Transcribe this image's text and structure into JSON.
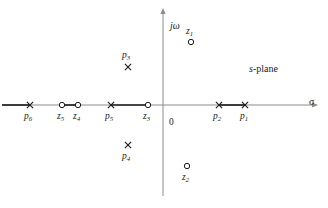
{
  "figure": {
    "kind": "s-plane pole-zero plot",
    "annotation": "s-plane",
    "origin_label": "0",
    "axes": {
      "real": {
        "symbol": "σ",
        "name": "sigma-axis"
      },
      "imag": {
        "symbol": "jω",
        "name": "j-omega-axis"
      }
    },
    "colors": {
      "axis": "#8c8c8c",
      "segment": "#1a1a1a",
      "marker": "#1a1a1a",
      "text": "#1a1a1a",
      "background": "#ffffff"
    }
  },
  "chart_data": {
    "type": "scatter",
    "title": "s-plane",
    "xlabel": "σ",
    "ylabel": "jω",
    "grid": false,
    "legend": null,
    "axis_origin_px": {
      "x": 163,
      "y": 105
    },
    "markers": [
      {
        "id": "p1",
        "label": "p",
        "sub": "1",
        "type": "pole",
        "glyph": "x",
        "x": 245,
        "y": 105,
        "label_x": 240,
        "label_y": 112,
        "on_real_axis": true
      },
      {
        "id": "p2",
        "label": "p",
        "sub": "2",
        "type": "pole",
        "glyph": "x",
        "x": 219,
        "y": 105,
        "label_x": 213,
        "label_y": 112,
        "on_real_axis": true
      },
      {
        "id": "p3",
        "label": "p",
        "sub": "3",
        "type": "pole",
        "glyph": "x",
        "x": 128,
        "y": 67,
        "label_x": 122,
        "label_y": 51,
        "on_real_axis": false
      },
      {
        "id": "p4",
        "label": "p",
        "sub": "4",
        "type": "pole",
        "glyph": "x",
        "x": 128,
        "y": 145,
        "label_x": 122,
        "label_y": 152,
        "on_real_axis": false
      },
      {
        "id": "p5",
        "label": "p",
        "sub": "5",
        "type": "pole",
        "glyph": "x",
        "x": 111,
        "y": 105,
        "label_x": 105,
        "label_y": 112,
        "on_real_axis": true
      },
      {
        "id": "p6",
        "label": "p",
        "sub": "6",
        "type": "pole",
        "glyph": "x",
        "x": 30,
        "y": 105,
        "label_x": 24,
        "label_y": 112,
        "on_real_axis": true
      },
      {
        "id": "z1",
        "label": "z",
        "sub": "1",
        "type": "zero",
        "glyph": "o",
        "x": 191,
        "y": 42,
        "label_x": 186,
        "label_y": 27,
        "on_real_axis": false
      },
      {
        "id": "z2",
        "label": "z",
        "sub": "2",
        "type": "zero",
        "glyph": "o",
        "x": 187,
        "y": 166,
        "label_x": 182,
        "label_y": 173,
        "on_real_axis": false
      },
      {
        "id": "z3",
        "label": "z",
        "sub": "3",
        "type": "zero",
        "glyph": "o",
        "x": 148,
        "y": 105,
        "label_x": 143,
        "label_y": 112,
        "on_real_axis": true
      },
      {
        "id": "z4",
        "label": "z",
        "sub": "4",
        "type": "zero",
        "glyph": "o",
        "x": 78,
        "y": 105,
        "label_x": 73,
        "label_y": 112,
        "on_real_axis": true
      },
      {
        "id": "z5",
        "label": "z",
        "sub": "5",
        "type": "zero",
        "glyph": "o",
        "x": 62,
        "y": 105,
        "label_x": 57,
        "label_y": 112,
        "on_real_axis": true
      }
    ],
    "highlighted_segments": [
      {
        "id": "seg-p6-left",
        "from_x": 2,
        "to_x": 30,
        "y": 105,
        "between": [
          "axis-left-edge",
          "p6"
        ]
      },
      {
        "id": "seg-z5-z4",
        "from_x": 62,
        "to_x": 78,
        "y": 105,
        "between": [
          "z5",
          "z4"
        ]
      },
      {
        "id": "seg-p5-z3",
        "from_x": 111,
        "to_x": 148,
        "y": 105,
        "between": [
          "p5",
          "z3"
        ]
      },
      {
        "id": "seg-p2-p1",
        "from_x": 219,
        "to_x": 245,
        "y": 105,
        "between": [
          "p2",
          "p1"
        ]
      }
    ],
    "axis_geometry": {
      "real_axis": {
        "x1": 2,
        "x2": 312,
        "y": 105,
        "arrow": "right"
      },
      "imag_axis": {
        "x": 163,
        "y1": 14,
        "y2": 196,
        "arrow": "up"
      }
    },
    "labels": {
      "sigma_x": 309,
      "sigma_y": 97,
      "jomega_x": 170,
      "jomega_y": 21,
      "origin_x": 169,
      "origin_y": 118,
      "splane_x": 249,
      "splane_y": 64
    }
  }
}
